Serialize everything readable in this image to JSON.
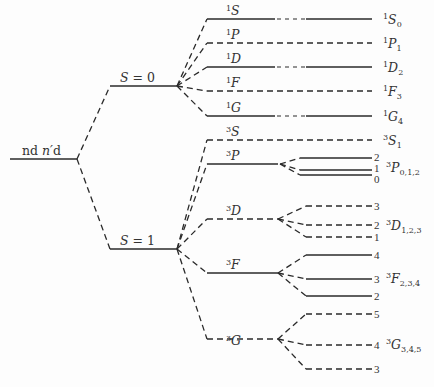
{
  "diagram": {
    "type": "energy-level-splitting",
    "colors": {
      "line": "#2a2a2a",
      "text": "#333333",
      "background": "#fdfdfd"
    },
    "configuration": {
      "label": "nd n′d",
      "label_parts": [
        "n",
        "d",
        " n′",
        "d"
      ]
    },
    "spin_levels": [
      {
        "id": "S0",
        "label": "S = 0",
        "style": "solid"
      },
      {
        "id": "S1",
        "label": "S = 1",
        "style": "solid"
      }
    ],
    "terms": [
      {
        "id": "1S",
        "mult": "1",
        "L": "S",
        "style": "solid"
      },
      {
        "id": "1P",
        "mult": "1",
        "L": "P",
        "style": "dashed"
      },
      {
        "id": "1D",
        "mult": "1",
        "L": "D",
        "style": "solid"
      },
      {
        "id": "1F",
        "mult": "1",
        "L": "F",
        "style": "dashed"
      },
      {
        "id": "1G",
        "mult": "1",
        "L": "G",
        "style": "solid"
      },
      {
        "id": "3S",
        "mult": "3",
        "L": "S",
        "style": "dashed"
      },
      {
        "id": "3P",
        "mult": "3",
        "L": "P",
        "style": "solid"
      },
      {
        "id": "3D",
        "mult": "3",
        "L": "D",
        "style": "dashed"
      },
      {
        "id": "3F",
        "mult": "3",
        "L": "F",
        "style": "solid"
      },
      {
        "id": "3G",
        "mult": "3",
        "L": "G",
        "style": "dashed"
      }
    ],
    "final_levels": [
      {
        "mult": "1",
        "L": "S",
        "J": "0"
      },
      {
        "mult": "1",
        "L": "P",
        "J": "1"
      },
      {
        "mult": "1",
        "L": "D",
        "J": "2"
      },
      {
        "mult": "1",
        "L": "F",
        "J": "3"
      },
      {
        "mult": "1",
        "L": "G",
        "J": "4"
      },
      {
        "mult": "3",
        "L": "S",
        "J": "1"
      },
      {
        "mult": "3",
        "L": "P",
        "J": "0,1,2",
        "sublevels": [
          "2",
          "1",
          "0"
        ]
      },
      {
        "mult": "3",
        "L": "D",
        "J": "1,2,3",
        "sublevels": [
          "3",
          "2",
          "1"
        ]
      },
      {
        "mult": "3",
        "L": "F",
        "J": "2,3,4",
        "sublevels": [
          "4",
          "3",
          "2"
        ]
      },
      {
        "mult": "3",
        "L": "G",
        "J": "3,4,5",
        "sublevels": [
          "5",
          "4",
          "3"
        ]
      }
    ]
  }
}
